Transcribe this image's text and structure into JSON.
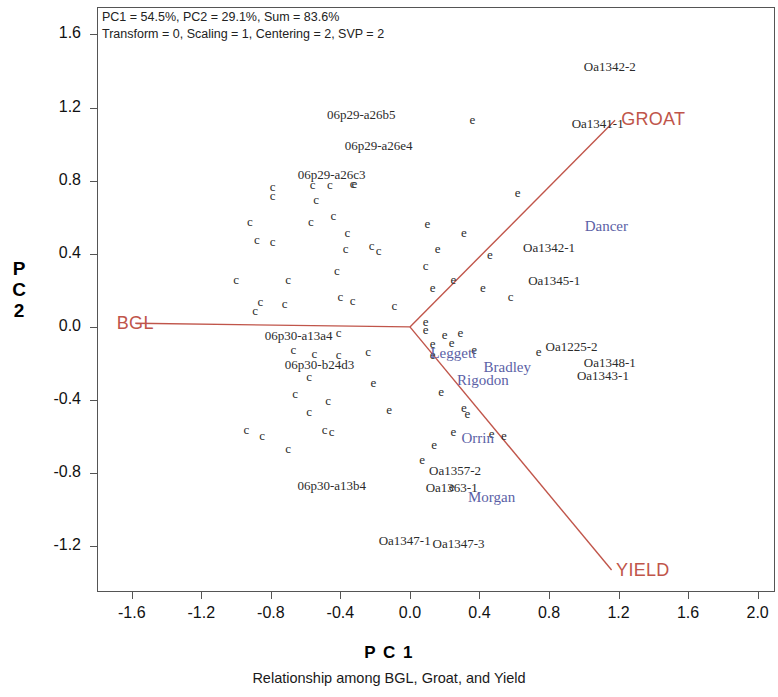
{
  "figure": {
    "caption": "Relationship among BGL, Groat, and Yield",
    "x_axis_title": "P C 1",
    "y_axis_title": "P C 2",
    "annotation_line1": "PC1 = 54.5%, PC2 = 29.1%, Sum = 83.6%",
    "annotation_line2": "Transform = 0, Scaling = 1, Centering = 2, SVP = 2",
    "accent_vector_color": "#c0554a",
    "variety_label_color": "#5b5fa6",
    "genotype_label_color": "#2b2b2b"
  },
  "chart_data": {
    "type": "scatter",
    "title": "Relationship among BGL, Groat, and Yield",
    "xlabel": "P C 1",
    "ylabel": "P C 2",
    "xlim": [
      -1.8,
      2.1
    ],
    "ylim": [
      -1.45,
      1.75
    ],
    "xticks": [
      -1.6,
      -1.2,
      -0.8,
      -0.4,
      0.0,
      0.4,
      0.8,
      1.2,
      1.6,
      2.0
    ],
    "yticks": [
      1.6,
      1.2,
      0.8,
      0.4,
      0.0,
      -0.4,
      -0.8,
      -1.2
    ],
    "xtick_labels": [
      "-1.6",
      "-1.2",
      "-0.8",
      "-0.4",
      "0.0",
      "0.4",
      "0.8",
      "1.2",
      "1.6",
      "2.0"
    ],
    "ytick_labels": [
      "1.6",
      "1.2",
      "0.8",
      "0.4",
      "0.0",
      "-0.4",
      "-0.8",
      "-1.2"
    ],
    "grid": false,
    "legend": "none",
    "variance_explained": {
      "PC1": 54.5,
      "PC2": 29.1,
      "sum": 83.6
    },
    "options": {
      "Transform": 0,
      "Scaling": 1,
      "Centering": 2,
      "SVP": 2
    },
    "vector_origin": {
      "x": 0.0,
      "y": 0.0
    },
    "vectors": [
      {
        "name": "BGL",
        "x": -1.58,
        "y": 0.02,
        "label": "BGL"
      },
      {
        "name": "GROAT",
        "x": 1.18,
        "y": 1.13,
        "label": "GROAT"
      },
      {
        "name": "YIELD",
        "x": 1.16,
        "y": -1.33,
        "label": "YIELD"
      }
    ],
    "marker_series": [
      {
        "name": "c-markers",
        "glyph": "c",
        "points": [
          {
            "x": -0.79,
            "y": 0.77
          },
          {
            "x": -0.79,
            "y": 0.72
          },
          {
            "x": -0.56,
            "y": 0.78
          },
          {
            "x": -0.46,
            "y": 0.78
          },
          {
            "x": -0.33,
            "y": 0.79
          },
          {
            "x": -0.54,
            "y": 0.7
          },
          {
            "x": -0.92,
            "y": 0.58
          },
          {
            "x": -0.57,
            "y": 0.58
          },
          {
            "x": -0.44,
            "y": 0.61
          },
          {
            "x": -0.88,
            "y": 0.48
          },
          {
            "x": -0.79,
            "y": 0.47
          },
          {
            "x": -0.36,
            "y": 0.52
          },
          {
            "x": -0.37,
            "y": 0.43
          },
          {
            "x": -1.0,
            "y": 0.26
          },
          {
            "x": -0.7,
            "y": 0.26
          },
          {
            "x": -0.42,
            "y": 0.31
          },
          {
            "x": -0.86,
            "y": 0.14
          },
          {
            "x": -0.89,
            "y": 0.09
          },
          {
            "x": -0.72,
            "y": 0.13
          },
          {
            "x": -0.4,
            "y": 0.17
          },
          {
            "x": -0.33,
            "y": 0.15
          },
          {
            "x": -0.41,
            "y": -0.03
          },
          {
            "x": -0.67,
            "y": -0.12
          },
          {
            "x": -0.55,
            "y": -0.14
          },
          {
            "x": -0.41,
            "y": -0.15
          },
          {
            "x": -0.24,
            "y": -0.13
          },
          {
            "x": -0.58,
            "y": -0.27
          },
          {
            "x": -0.66,
            "y": -0.36
          },
          {
            "x": -0.47,
            "y": -0.4
          },
          {
            "x": -0.58,
            "y": -0.46
          },
          {
            "x": -0.94,
            "y": -0.56
          },
          {
            "x": -0.85,
            "y": -0.59
          },
          {
            "x": -0.7,
            "y": -0.66
          },
          {
            "x": -0.49,
            "y": -0.56
          },
          {
            "x": -0.45,
            "y": -0.57
          },
          {
            "x": 0.09,
            "y": 0.34
          },
          {
            "x": -0.18,
            "y": 0.42
          },
          {
            "x": -0.22,
            "y": 0.45
          },
          {
            "x": 0.58,
            "y": 0.17
          },
          {
            "x": -0.09,
            "y": 0.12
          }
        ]
      },
      {
        "name": "e-markers",
        "glyph": "e",
        "points": [
          {
            "x": 0.36,
            "y": 1.14
          },
          {
            "x": -0.32,
            "y": 0.79
          },
          {
            "x": 0.62,
            "y": 0.74
          },
          {
            "x": 0.1,
            "y": 0.57
          },
          {
            "x": 0.31,
            "y": 0.52
          },
          {
            "x": 0.16,
            "y": 0.43
          },
          {
            "x": 0.46,
            "y": 0.4
          },
          {
            "x": 0.25,
            "y": 0.26
          },
          {
            "x": 0.13,
            "y": 0.22
          },
          {
            "x": 0.42,
            "y": 0.22
          },
          {
            "x": 0.09,
            "y": 0.03
          },
          {
            "x": 0.09,
            "y": -0.01
          },
          {
            "x": 0.2,
            "y": -0.04
          },
          {
            "x": 0.29,
            "y": -0.03
          },
          {
            "x": 0.13,
            "y": -0.09
          },
          {
            "x": 0.24,
            "y": -0.08
          },
          {
            "x": 0.13,
            "y": -0.15
          },
          {
            "x": 0.37,
            "y": -0.12
          },
          {
            "x": 0.74,
            "y": -0.13
          },
          {
            "x": 0.18,
            "y": -0.35
          },
          {
            "x": 0.31,
            "y": -0.44
          },
          {
            "x": 0.33,
            "y": -0.47
          },
          {
            "x": 0.25,
            "y": -0.57
          },
          {
            "x": 0.47,
            "y": -0.58
          },
          {
            "x": 0.54,
            "y": -0.59
          },
          {
            "x": 0.14,
            "y": -0.64
          },
          {
            "x": 0.07,
            "y": -0.72
          },
          {
            "x": 0.24,
            "y": -0.87
          },
          {
            "x": -0.21,
            "y": -0.3
          },
          {
            "x": -0.12,
            "y": -0.45
          }
        ]
      }
    ],
    "point_labels": [
      {
        "text": "Oa1342-2",
        "x": 1.15,
        "y": 1.42,
        "kind": "genotype"
      },
      {
        "text": "06p29-a26b5",
        "x": -0.28,
        "y": 1.16,
        "kind": "genotype"
      },
      {
        "text": "Oa1341-1",
        "x": 1.08,
        "y": 1.11,
        "kind": "genotype"
      },
      {
        "text": "06p29-a26e4",
        "x": -0.18,
        "y": 0.99,
        "kind": "genotype"
      },
      {
        "text": "06p29-a26c3",
        "x": -0.45,
        "y": 0.83,
        "kind": "genotype"
      },
      {
        "text": "Dancer",
        "x": 1.13,
        "y": 0.55,
        "kind": "variety"
      },
      {
        "text": "Oa1342-1",
        "x": 0.8,
        "y": 0.43,
        "kind": "genotype"
      },
      {
        "text": "Oa1345-1",
        "x": 0.83,
        "y": 0.25,
        "kind": "genotype"
      },
      {
        "text": "BGL",
        "x": -1.58,
        "y": 0.02,
        "kind": "vector"
      },
      {
        "text": "06p30-a13a4",
        "x": -0.64,
        "y": -0.05,
        "kind": "genotype"
      },
      {
        "text": "Leggett",
        "x": 0.25,
        "y": -0.14,
        "kind": "variety"
      },
      {
        "text": "Oa1225-2",
        "x": 0.93,
        "y": -0.11,
        "kind": "genotype"
      },
      {
        "text": "Bradley",
        "x": 0.56,
        "y": -0.22,
        "kind": "variety"
      },
      {
        "text": "Oa1348-1",
        "x": 1.15,
        "y": -0.2,
        "kind": "genotype"
      },
      {
        "text": "06p30-b24d3",
        "x": -0.52,
        "y": -0.21,
        "kind": "genotype"
      },
      {
        "text": "Rigodon",
        "x": 0.42,
        "y": -0.29,
        "kind": "variety"
      },
      {
        "text": "Oa1343-1",
        "x": 1.11,
        "y": -0.27,
        "kind": "genotype"
      },
      {
        "text": "Orrin",
        "x": 0.39,
        "y": -0.61,
        "kind": "variety"
      },
      {
        "text": "Oa1357-2",
        "x": 0.26,
        "y": -0.79,
        "kind": "genotype"
      },
      {
        "text": "06p30-a13b4",
        "x": -0.45,
        "y": -0.87,
        "kind": "genotype"
      },
      {
        "text": "Oa1363-1",
        "x": 0.24,
        "y": -0.88,
        "kind": "genotype"
      },
      {
        "text": "Morgan",
        "x": 0.47,
        "y": -0.93,
        "kind": "variety"
      },
      {
        "text": "Oa1347-1",
        "x": -0.03,
        "y": -1.17,
        "kind": "genotype"
      },
      {
        "text": "Oa1347-3",
        "x": 0.28,
        "y": -1.19,
        "kind": "genotype"
      },
      {
        "text": "GROAT",
        "x": 1.4,
        "y": 1.14,
        "kind": "vector"
      },
      {
        "text": "YIELD",
        "x": 1.34,
        "y": -1.33,
        "kind": "vector"
      }
    ]
  }
}
